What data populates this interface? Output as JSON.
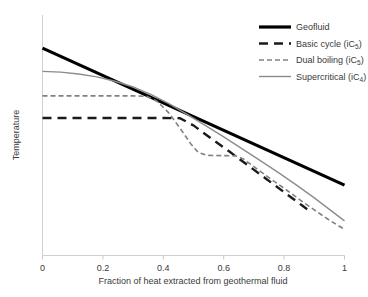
{
  "chart_data": {
    "type": "line",
    "title": "",
    "xlabel": "Fraction of heat extracted from geothermal fluid",
    "ylabel": "Temperature",
    "xlim": [
      0,
      1
    ],
    "ylim": [
      0,
      1
    ],
    "grid": false,
    "legend_position": "top-right",
    "xticks": [
      "0",
      "0.2",
      "0.4",
      "0.6",
      "0.8",
      "1"
    ],
    "xtick_values": [
      0,
      0.2,
      0.4,
      0.6,
      0.8,
      1
    ],
    "yticks": [],
    "series": [
      {
        "name": "Geofluid",
        "label": "Geofluid",
        "label_sub": "",
        "label_tail": "",
        "color": "#000000",
        "width": 3.2,
        "dash": "none",
        "x": [
          0,
          1
        ],
        "y": [
          0.862,
          0.291
        ]
      },
      {
        "name": "Basic cycle",
        "label": "Basic cycle (iC",
        "label_sub": "5",
        "label_tail": ")",
        "color": "#1a1a1a",
        "width": 2.4,
        "dash": "9,6",
        "x": [
          0,
          0.1,
          0.2,
          0.3,
          0.4,
          0.455,
          0.5,
          0.56,
          0.62,
          0.68,
          0.74,
          0.8,
          0.86,
          0.89
        ],
        "y": [
          0.571,
          0.571,
          0.571,
          0.571,
          0.571,
          0.57,
          0.54,
          0.484,
          0.43,
          0.374,
          0.318,
          0.262,
          0.206,
          0.178
        ]
      },
      {
        "name": "Dual boiling",
        "label": "Dual boiling (iC",
        "label_sub": "5",
        "label_tail": ")",
        "color": "#808080",
        "width": 1.6,
        "dash": "5,3",
        "x": [
          0,
          0.1,
          0.2,
          0.3,
          0.345,
          0.38,
          0.42,
          0.46,
          0.49,
          0.515,
          0.545,
          0.6,
          0.64,
          0.665,
          0.7,
          0.75,
          0.8,
          0.85,
          0.9,
          0.95,
          1.0
        ],
        "y": [
          0.663,
          0.663,
          0.663,
          0.663,
          0.661,
          0.64,
          0.59,
          0.52,
          0.465,
          0.428,
          0.415,
          0.414,
          0.413,
          0.4,
          0.368,
          0.322,
          0.278,
          0.232,
          0.188,
          0.145,
          0.107
        ]
      },
      {
        "name": "Supercritical",
        "label": "Supercritical (iC",
        "label_sub": "4",
        "label_tail": ")",
        "color": "#8c8c8c",
        "width": 1.4,
        "dash": "none",
        "x": [
          0,
          0.06,
          0.12,
          0.18,
          0.24,
          0.3,
          0.36,
          0.42,
          0.48,
          0.54,
          0.6,
          0.66,
          0.72,
          0.78,
          0.84,
          0.9,
          0.95,
          1.0
        ],
        "y": [
          0.765,
          0.762,
          0.754,
          0.742,
          0.724,
          0.7,
          0.668,
          0.63,
          0.585,
          0.539,
          0.492,
          0.443,
          0.394,
          0.344,
          0.292,
          0.238,
          0.19,
          0.142
        ]
      }
    ]
  },
  "legend": {
    "items": [
      {
        "label": "Geofluid",
        "sub": "",
        "tail": ""
      },
      {
        "label": "Basic cycle (iC",
        "sub": "5",
        "tail": ")"
      },
      {
        "label": "Dual boiling (iC",
        "sub": "5",
        "tail": ")"
      },
      {
        "label": "Supercritical (iC",
        "sub": "4",
        "tail": ")"
      }
    ]
  }
}
